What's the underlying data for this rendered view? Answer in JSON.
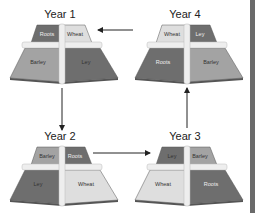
{
  "diagram": {
    "colors": {
      "dark": "#6e6e6e",
      "medium": "#a3a3a3",
      "light": "#dedede",
      "path": "#eeeeee",
      "edge": "#555555",
      "arrow": "#222222",
      "side_strip": "#6a6a6a"
    },
    "fields": [
      {
        "id": "year1",
        "title": "Year 1",
        "top_left": "Roots",
        "top_right": "Wheat",
        "bottom_left": "Barley",
        "bottom_right": "Ley"
      },
      {
        "id": "year2",
        "title": "Year 2",
        "top_left": "Barley",
        "top_right": "Roots",
        "bottom_left": "Ley",
        "bottom_right": "Wheat"
      },
      {
        "id": "year3",
        "title": "Year 3",
        "top_left": "Ley",
        "top_right": "Barley",
        "bottom_left": "Wheat",
        "bottom_right": "Roots"
      },
      {
        "id": "year4",
        "title": "Year 4",
        "top_left": "Wheat",
        "top_right": "Ley",
        "bottom_left": "Roots",
        "bottom_right": "Barley"
      }
    ],
    "arrows": [
      {
        "from": "Year 1",
        "to": "Year 2",
        "direction": "down"
      },
      {
        "from": "Year 2",
        "to": "Year 3",
        "direction": "right"
      },
      {
        "from": "Year 3",
        "to": "Year 4",
        "direction": "up"
      },
      {
        "from": "Year 4",
        "to": "Year 1",
        "direction": "left"
      }
    ]
  }
}
